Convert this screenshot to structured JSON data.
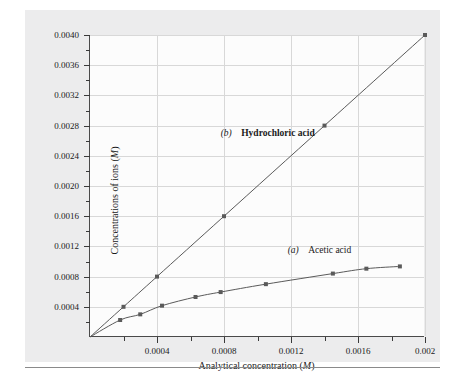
{
  "figure": {
    "background_color": "#ececed",
    "plot_background_color": "#fcfcfc",
    "axis_color": "#4a4a4a",
    "grid_color": "#d8d8d8",
    "curve_color": "#5a5a5a"
  },
  "chart_data": {
    "type": "line",
    "title": "",
    "subtitle": "",
    "xlabel_text": "Analytical concentration (",
    "xlabel_italic": "M",
    "xlabel_tail": ")",
    "ylabel_text": "Concentrations of ions (",
    "ylabel_italic": "M",
    "ylabel_tail": ")",
    "xlim": [
      0,
      0.002
    ],
    "ylim": [
      0,
      0.004
    ],
    "grid": true,
    "legend_position": "inline-annotations",
    "xticks": [
      0.0004,
      0.0008,
      0.0012,
      0.0016,
      0.002
    ],
    "xtick_labels": [
      "0.0004",
      "0.0008",
      "0.0012",
      "0.0016",
      "0.002"
    ],
    "xminor_ticks": [
      0.0002,
      0.0006,
      0.001,
      0.0014,
      0.0018
    ],
    "yticks": [
      0.0004,
      0.0008,
      0.0012,
      0.0016,
      0.002,
      0.0024,
      0.0028,
      0.0032,
      0.0036,
      0.004
    ],
    "ytick_labels": [
      "0.0004",
      "0.0008",
      "0.0012",
      "0.0016",
      "0.0020",
      "0.0024",
      "0.0028",
      "0.0032",
      "0.0036",
      "0.0040"
    ],
    "yminor_ticks": [
      0.0002,
      0.0006,
      0.001,
      0.0014,
      0.0018,
      0.0022,
      0.0026,
      0.003,
      0.0034,
      0.0038
    ],
    "series": [
      {
        "name": "Hydrochloric acid",
        "letter": "b",
        "annotation": "(b)  Hydrochloric acid",
        "annotation_x": 0.00078,
        "annotation_y": 0.00268,
        "marker": "square",
        "x": [
          0.0,
          0.0002,
          0.0004,
          0.0008,
          0.0014,
          0.002
        ],
        "y": [
          0.0,
          0.0004,
          0.0008,
          0.0016,
          0.0028,
          0.004
        ]
      },
      {
        "name": "Acetic acid",
        "letter": "a",
        "annotation": "(a)  Acetic acid",
        "annotation_x": 0.00118,
        "annotation_y": 0.00112,
        "marker": "square",
        "x": [
          0.0,
          0.00018,
          0.0003,
          0.00043,
          0.00063,
          0.00078,
          0.00105,
          0.00145,
          0.00165,
          0.00185
        ],
        "y": [
          0.0,
          0.000225,
          0.0003,
          0.000415,
          0.00053,
          0.000595,
          0.0007,
          0.00084,
          0.000905,
          0.000935
        ]
      }
    ]
  }
}
